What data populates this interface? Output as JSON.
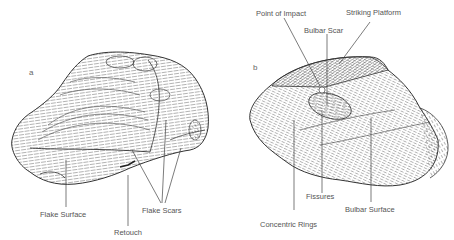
{
  "figure": {
    "panels": [
      {
        "id": "a",
        "letter": "a",
        "labels": {
          "flake_surface": "Flake Surface",
          "retouch": "Retouch",
          "flake_scars": "Flake Scars"
        }
      },
      {
        "id": "b",
        "letter": "b",
        "labels": {
          "point_of_impact": "Point of Impact",
          "striking_platform": "Striking Platform",
          "bulbar_scar": "Bulbar Scar",
          "fissures": "Fissures",
          "bulbar_surface": "Bulbar Surface",
          "concentric_rings": "Concentric Rings"
        }
      }
    ],
    "colors": {
      "ink": "#3a3a3a",
      "label": "#555555",
      "background": "#ffffff"
    }
  }
}
